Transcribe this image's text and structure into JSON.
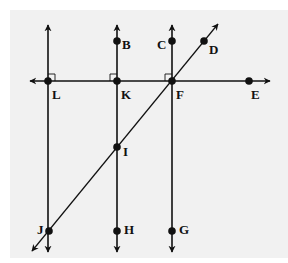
{
  "diagram": {
    "caption_fragment": "",
    "background_color": "#f1f1f1",
    "line_color": "#111111",
    "horizontal_line": {
      "name": "line-LKFE",
      "y": 81,
      "x1": 30,
      "x2": 270,
      "arrows": "both"
    },
    "vertical_lines": [
      {
        "name": "line-LJ",
        "x": 48,
        "y1": 25,
        "y2": 252
      },
      {
        "name": "line-BKIH",
        "x": 117,
        "y1": 25,
        "y2": 252
      },
      {
        "name": "line-CFG",
        "x": 172,
        "y1": 25,
        "y2": 252
      }
    ],
    "transversal": {
      "name": "line-DFIJ",
      "x1": 32,
      "y1": 251,
      "x2": 218,
      "y2": 24,
      "arrows": "both"
    },
    "right_angle_marks": [
      {
        "at": "L",
        "x": 48,
        "y": 81,
        "side": "upper-right"
      },
      {
        "at": "K",
        "x": 117,
        "y": 81,
        "side": "upper-left"
      },
      {
        "at": "F",
        "x": 172,
        "y": 81,
        "side": "upper-left"
      }
    ],
    "points": [
      {
        "label": "B",
        "x": 117,
        "y": 41,
        "lx": 122,
        "ly": 46
      },
      {
        "label": "C",
        "x": 172,
        "y": 41,
        "lx": 157,
        "ly": 46
      },
      {
        "label": "D",
        "x": 204,
        "y": 41,
        "lx": 209,
        "ly": 51
      },
      {
        "label": "L",
        "x": 48,
        "y": 81,
        "lx": 52,
        "ly": 96
      },
      {
        "label": "K",
        "x": 117,
        "y": 81,
        "lx": 121,
        "ly": 96
      },
      {
        "label": "F",
        "x": 172,
        "y": 81,
        "lx": 176,
        "ly": 96
      },
      {
        "label": "E",
        "x": 249,
        "y": 81,
        "lx": 251,
        "ly": 96
      },
      {
        "label": "I",
        "x": 117,
        "y": 147,
        "lx": 123,
        "ly": 153
      },
      {
        "label": "J",
        "x": 49,
        "y": 231,
        "lx": 37,
        "ly": 231
      },
      {
        "label": "H",
        "x": 117,
        "y": 231,
        "lx": 124,
        "ly": 231
      },
      {
        "label": "G",
        "x": 172,
        "y": 231,
        "lx": 179,
        "ly": 231
      }
    ]
  }
}
